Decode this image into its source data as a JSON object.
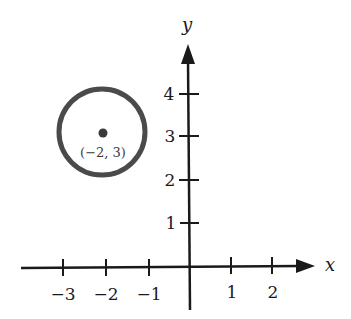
{
  "diagram": {
    "type": "coordinate-plane",
    "axes": {
      "x_label": "x",
      "y_label": "y",
      "x_ticks": [
        {
          "value": -3,
          "label": "−3"
        },
        {
          "value": -2,
          "label": "−2"
        },
        {
          "value": -1,
          "label": "−1"
        },
        {
          "value": 1,
          "label": "1"
        },
        {
          "value": 2,
          "label": "2"
        }
      ],
      "y_ticks": [
        {
          "value": 1,
          "label": "1"
        },
        {
          "value": 2,
          "label": "2"
        },
        {
          "value": 3,
          "label": "3"
        },
        {
          "value": 4,
          "label": "4"
        }
      ]
    },
    "circle": {
      "center": [
        -2,
        3
      ],
      "center_label": "(−2, 3)",
      "radius": 1,
      "stroke_color": "#4a4a4a",
      "center_point_color": "#3a3a3a"
    },
    "axis_color": "#1a1a1a"
  }
}
